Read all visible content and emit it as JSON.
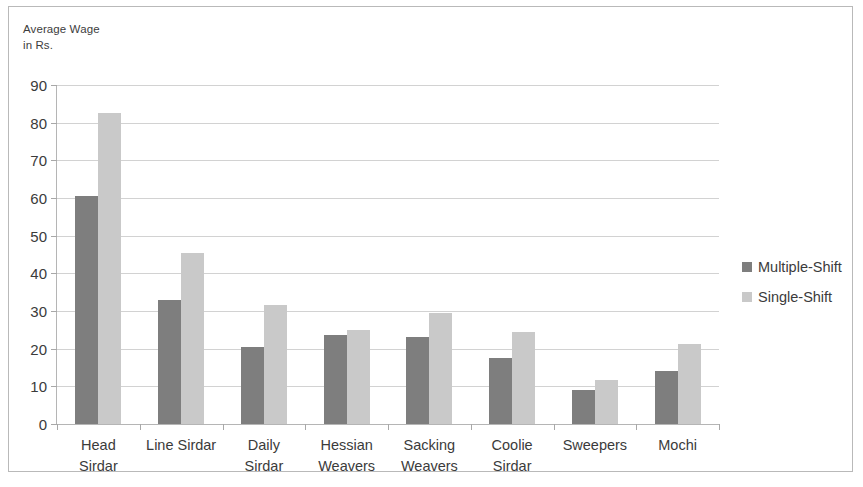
{
  "chart_data": {
    "type": "bar",
    "title": "",
    "subtitle": "",
    "xlabel": "",
    "ylabel": "Average Wage\nin Rs.",
    "ylim": [
      0,
      90
    ],
    "ytick_step": 10,
    "yticks": [
      90,
      80,
      70,
      60,
      50,
      40,
      30,
      20,
      10,
      0
    ],
    "ytick_labels": [
      "90",
      "80",
      "70",
      "60",
      "50",
      "40",
      "30",
      "20",
      "10",
      "0"
    ],
    "grid": true,
    "legend_position": "right",
    "categories": [
      "Head\nSirdar",
      "Line Sirdar",
      "Daily\nSirdar",
      "Hessian\nWeavers",
      "Sacking\nWeavers",
      "Coolie\nSirdar",
      "Sweepers",
      "Mochi"
    ],
    "series": [
      {
        "name": "Multiple-Shift",
        "color": "#7e7e7e",
        "values": [
          60.5,
          33,
          20.5,
          23.5,
          23,
          17.5,
          9,
          14
        ]
      },
      {
        "name": "Single-Shift",
        "color": "#c9c9c9",
        "values": [
          82.5,
          45.5,
          31.5,
          25,
          29.5,
          24.5,
          11.8,
          21.3
        ]
      }
    ]
  },
  "legend": {
    "entries": [
      {
        "label": "Multiple-Shift",
        "color": "#7e7e7e"
      },
      {
        "label": "Single-Shift",
        "color": "#c9c9c9"
      }
    ]
  },
  "colors": {
    "multiple_shift": "#7e7e7e",
    "single_shift": "#c9c9c9",
    "gridline": "#d2d2d2",
    "axis": "#b5b5b5",
    "frame": "#b9b9b9",
    "text": "#3b3b3b"
  }
}
